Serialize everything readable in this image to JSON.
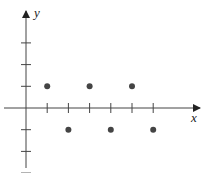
{
  "chart_data": {
    "type": "scatter",
    "title": "",
    "xlabel": "x",
    "ylabel": "y",
    "x": [
      1,
      2,
      3,
      4,
      5,
      6
    ],
    "values": [
      1,
      -1,
      1,
      -1,
      1,
      -1
    ],
    "x_ticks": [
      1,
      2,
      3,
      4,
      5,
      6
    ],
    "y_ticks": [
      -3,
      -2,
      -1,
      1,
      2,
      3
    ],
    "xlim": [
      -0.3,
      8.5
    ],
    "ylim": [
      -3.6,
      4.6
    ],
    "grid": false,
    "legend": null,
    "colors": {
      "axis": "#333333",
      "points": "#444444"
    }
  },
  "axes": {
    "x_label": "x",
    "y_label": "y"
  }
}
